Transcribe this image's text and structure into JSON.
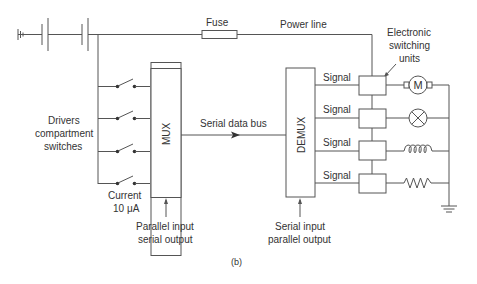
{
  "diagram": {
    "caption": "(b)",
    "labels": {
      "fuse": "Fuse",
      "power_line": "Power line",
      "esu_line1": "Electronic",
      "esu_line2": "switching",
      "esu_line3": "units",
      "drivers_line1": "Drivers",
      "drivers_line2": "compartment",
      "drivers_line3": "switches",
      "current_line1": "Current",
      "current_line2": "10 μA",
      "serial_bus": "Serial data bus",
      "mux": "MUX",
      "demux": "DEMUX",
      "mux_note_line1": "Parallel input",
      "mux_note_line2": "serial output",
      "demux_note_line1": "Serial input",
      "demux_note_line2": "parallel output",
      "motor_symbol": "M"
    },
    "signals": [
      "Signal",
      "Signal",
      "Signal",
      "Signal"
    ],
    "loads": [
      "motor-icon",
      "lamp-icon",
      "inductor-icon",
      "resistor-icon"
    ],
    "colors": {
      "line": "#555555",
      "text": "#333333",
      "background": "#ffffff"
    }
  }
}
